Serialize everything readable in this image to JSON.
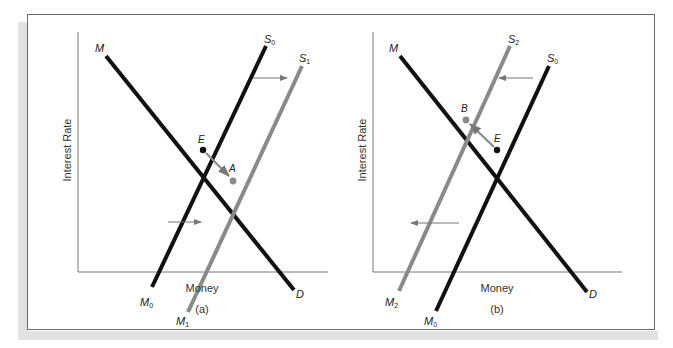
{
  "figure": {
    "panels": [
      {
        "id": "a",
        "caption": "(a)",
        "ylabel": "Interest Rate",
        "xlabel": "Money",
        "curves": [
          {
            "name": "M",
            "end_label": "D",
            "type": "demand",
            "color": "#111111"
          },
          {
            "name": "S0",
            "end_label": "M0",
            "type": "supply",
            "color": "#111111"
          },
          {
            "name": "S1",
            "end_label": "M1",
            "type": "supply",
            "color": "#8a8a8a"
          }
        ],
        "points": [
          {
            "label": "E",
            "color": "#111111"
          },
          {
            "label": "A",
            "color": "#8a8a8a"
          }
        ],
        "shift": "right"
      },
      {
        "id": "b",
        "caption": "(b)",
        "ylabel": "Interest Rate",
        "xlabel": "Money",
        "curves": [
          {
            "name": "M",
            "end_label": "D",
            "type": "demand",
            "color": "#111111"
          },
          {
            "name": "S2",
            "end_label": "M2",
            "type": "supply",
            "color": "#8a8a8a"
          },
          {
            "name": "S0",
            "end_label": "M0",
            "type": "supply",
            "color": "#111111"
          }
        ],
        "points": [
          {
            "label": "B",
            "color": "#8a8a8a"
          },
          {
            "label": "E",
            "color": "#111111"
          }
        ],
        "shift": "left"
      }
    ],
    "labels": {
      "a_M": "M",
      "a_D": "D",
      "a_S": "S",
      "a_S0_sub": "0",
      "a_S1_sub": "1",
      "a_M0": "M",
      "a_M0_sub": "0",
      "a_M1": "M",
      "a_M1_sub": "1",
      "a_E": "E",
      "a_A": "A",
      "b_M": "M",
      "b_D": "D",
      "b_S": "S",
      "b_S2_sub": "2",
      "b_S0_sub": "0",
      "b_M2": "M",
      "b_M2_sub": "2",
      "b_M0": "M",
      "b_M0_sub": "0",
      "b_B": "B",
      "b_E": "E"
    }
  }
}
